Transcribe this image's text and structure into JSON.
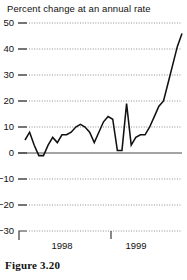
{
  "figure": {
    "caption": "Figure 3.20"
  },
  "chart_data": {
    "type": "line",
    "title": "Percent change at an annual rate",
    "xlabel": "",
    "ylabel": "",
    "ylim": [
      -30,
      50
    ],
    "yticks": [
      50,
      40,
      30,
      20,
      10,
      0,
      -10,
      -20,
      -30
    ],
    "ytick_labels": [
      "50",
      "40",
      "30",
      "20",
      "10",
      "0",
      "−10",
      "−20",
      "−30"
    ],
    "xticks": [
      1998,
      1999
    ],
    "xtick_labels": [
      "1998",
      "1999"
    ],
    "grid": true,
    "gridline_style": "dotted",
    "zero_line": true,
    "legend": null,
    "series": [
      {
        "name": "Percent change at an annual rate",
        "color": "#111111",
        "x": [
          0,
          1,
          2,
          3,
          4,
          5,
          6,
          7,
          8,
          9,
          10,
          11,
          12,
          13,
          14,
          15,
          16,
          17,
          18,
          19,
          20,
          21,
          22,
          23,
          24,
          25,
          26,
          27,
          28,
          29,
          30,
          31,
          32,
          33,
          34
        ],
        "values": [
          5,
          8,
          3,
          -1,
          -1,
          3,
          6,
          4,
          7,
          7,
          8,
          10,
          11,
          10,
          8,
          4,
          8,
          12,
          14,
          13,
          1,
          1,
          19,
          3,
          6,
          7,
          7,
          10,
          14,
          18,
          20,
          27,
          34,
          41,
          46
        ]
      }
    ]
  }
}
